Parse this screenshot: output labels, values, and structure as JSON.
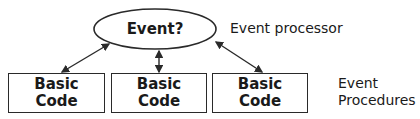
{
  "diagram": {
    "processor": {
      "label": "Event?",
      "caption": "Event processor"
    },
    "procedures": [
      {
        "line1": "Basic",
        "line2": "Code"
      },
      {
        "line1": "Basic",
        "line2": "Code"
      },
      {
        "line1": "Basic",
        "line2": "Code"
      }
    ],
    "procedures_caption": {
      "line1": "Event",
      "line2": "Procedures"
    },
    "colors": {
      "stroke": "#2a2a2a",
      "background": "#ffffff"
    }
  }
}
